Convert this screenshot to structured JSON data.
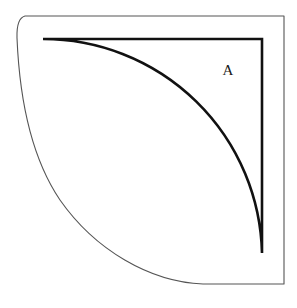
{
  "figure": {
    "background_color": "#ffffff",
    "labels": [
      {
        "id": "region-a",
        "text": "A",
        "x": 228,
        "y": 75,
        "description": "label for the quarter-disc region"
      }
    ],
    "outer_boundary": {
      "name": "outer-border-path",
      "stroke_color": "#555555",
      "stroke_width": 1.1,
      "fill": "none",
      "description": "thin outer outline: rounded top-left corner, straight top edge to top-right, straight right edge down, then a large concave arc sweeping from bottom-right up to the top-left corner",
      "top_edge_y": 16,
      "right_edge_x": 284,
      "bottom_edge_y": 284,
      "left_start_x": 17,
      "corner_radius": 8,
      "arc_radius": 268
    },
    "inner_sector": {
      "name": "quarter-circle-sector-path",
      "stroke_color": "#111111",
      "stroke_width": 2.6,
      "fill": "none",
      "description": "thick quarter-disc: vertical right edge, horizontal top edge, and a quarter-circle arc of radius 219 centred at the top-right corner",
      "center_x": 262,
      "center_y": 39,
      "radius": 219,
      "top_left_x": 43,
      "top_right_x": 262,
      "top_y": 39,
      "bottom_y": 253
    },
    "geometry": {
      "type": "quarter-circle",
      "angle_degrees": 90,
      "sector_radius": 219,
      "outer_offset": 26
    }
  }
}
